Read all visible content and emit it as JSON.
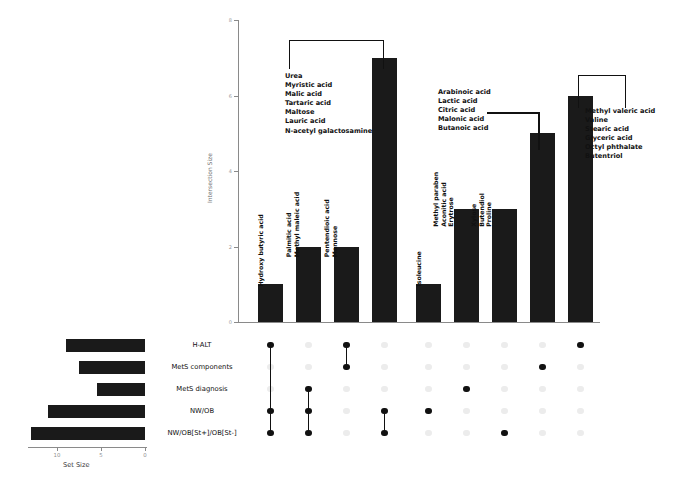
{
  "figure": {
    "type": "upset-plot",
    "background": "#ffffff",
    "mark_color": "#1a1a1a",
    "axis_color": "#8a8a8a"
  },
  "intersection_axis": {
    "title": "Intersection Size",
    "ticks": [
      "0",
      "2",
      "4",
      "6",
      "8"
    ],
    "tick_values": [
      0,
      2,
      4,
      6,
      8
    ],
    "max": 8
  },
  "setsize_axis": {
    "title": "Set Size",
    "ticks": [
      "10",
      "5",
      "0"
    ],
    "tick_values": [
      10,
      5,
      0
    ],
    "max": 14
  },
  "sets": [
    {
      "name": "H-ALT",
      "size": 9
    },
    {
      "name": "MetS components",
      "size": 7.5
    },
    {
      "name": "MetS diagnosis",
      "size": 5.5
    },
    {
      "name": "NW/OB",
      "size": 11
    },
    {
      "name": "NW/OB[St+]/OB[St-]",
      "size": 13
    }
  ],
  "intersections": [
    {
      "id": "i1",
      "size": 1,
      "members": [
        "H-ALT",
        "NW/OB",
        "NW/OB[St+]/OB[St-]"
      ],
      "metabolites": [
        "Hydroxy butyric acid"
      ],
      "label_style": "rotated"
    },
    {
      "id": "i2",
      "size": 2,
      "members": [
        "MetS diagnosis",
        "NW/OB",
        "NW/OB[St+]/OB[St-]"
      ],
      "metabolites": [
        "Palmitic acid",
        "Methyl maleic acid"
      ],
      "label_style": "rotated"
    },
    {
      "id": "i3",
      "size": 2,
      "members": [
        "H-ALT",
        "MetS components"
      ],
      "metabolites": [
        "Pentendioic acid",
        "Mannose"
      ],
      "label_style": "rotated"
    },
    {
      "id": "i4",
      "size": 7,
      "members": [
        "NW/OB",
        "NW/OB[St+]/OB[St-]"
      ],
      "metabolites": [
        "Urea",
        "Myristic acid",
        "Malic acid",
        "Tartaric acid",
        "Maltose",
        "Lauric acid",
        "N-acetyl galactosamine"
      ],
      "label_style": "callout"
    },
    {
      "id": "i5",
      "size": 1,
      "members": [
        "NW/OB"
      ],
      "metabolites": [
        "Isoleucine"
      ],
      "label_style": "rotated"
    },
    {
      "id": "i6",
      "size": 3,
      "members": [
        "MetS diagnosis"
      ],
      "metabolites": [
        "Methyl paraben",
        "Aconitic acid",
        "Erytrose"
      ],
      "label_style": "rotated"
    },
    {
      "id": "i7",
      "size": 3,
      "members": [
        "NW/OB[St+]/OB[St-]"
      ],
      "metabolites": [
        "Xylose",
        "Butendiol",
        "Proline"
      ],
      "label_style": "rotated"
    },
    {
      "id": "i8",
      "size": 5,
      "members": [
        "MetS components"
      ],
      "metabolites": [
        "Arabinoic acid",
        "Lactic acid",
        "Citric acid",
        "Malonic acid",
        "Butanoic acid"
      ],
      "label_style": "callout"
    },
    {
      "id": "i9",
      "size": 6,
      "members": [
        "H-ALT"
      ],
      "metabolites": [
        "Methyl valeric acid",
        "Valine",
        "Stearic acid",
        "Glyceric acid",
        "Octyl phthalate",
        "Butentriol"
      ],
      "label_style": "callout"
    }
  ],
  "callouts": {
    "left": {
      "lines": [
        "Urea",
        "Myristic acid",
        "Malic acid",
        "Tartaric acid",
        "Maltose",
        "Lauric acid",
        "N-acetyl galactosamine"
      ]
    },
    "middle": {
      "lines": [
        "Arabinoic acid",
        "Lactic acid",
        "Citric acid",
        "Malonic acid",
        "Butanoic acid"
      ]
    },
    "right": {
      "lines": [
        "Methyl valeric acid",
        "Valine",
        "Stearic acid",
        "Glyceric acid",
        "Octyl phthalate",
        "Butentriol"
      ]
    }
  },
  "rotated_labels": {
    "b1": [
      "Hydroxy butyric acid"
    ],
    "b2": [
      "Palmitic acid",
      "Methyl maleic acid"
    ],
    "b3": [
      "Pentendioic acid",
      "Mannose"
    ],
    "b5": [
      "Isoleucine"
    ],
    "b6": [
      "Methyl paraben",
      "Aconitic acid",
      "Erytrose"
    ],
    "b7": [
      "Xylose",
      "Butendiol",
      "Proline"
    ]
  },
  "chart_data": {
    "type": "bar",
    "title": "",
    "xlabel": "",
    "ylabel": "Intersection Size",
    "ylim": [
      0,
      8
    ],
    "categories": [
      "i1",
      "i2",
      "i3",
      "i4",
      "i5",
      "i6",
      "i7",
      "i8",
      "i9"
    ],
    "values": [
      1,
      2,
      2,
      7,
      1,
      3,
      3,
      5,
      6
    ],
    "grid": false,
    "legend": "none",
    "secondary": {
      "type": "bar",
      "orientation": "horizontal-reversed",
      "ylabel": "Set Size",
      "categories": [
        "H-ALT",
        "MetS components",
        "MetS diagnosis",
        "NW/OB",
        "NW/OB[St+]/OB[St-]"
      ],
      "values": [
        9,
        7.5,
        5.5,
        11,
        13
      ],
      "xlim": [
        14,
        0
      ],
      "ticks": [
        10,
        5,
        0
      ]
    },
    "matrix": [
      [
        1,
        0,
        0,
        1,
        1
      ],
      [
        0,
        0,
        1,
        1,
        1
      ],
      [
        1,
        1,
        0,
        0,
        0
      ],
      [
        0,
        0,
        0,
        1,
        1
      ],
      [
        0,
        0,
        0,
        1,
        0
      ],
      [
        0,
        0,
        1,
        0,
        0
      ],
      [
        0,
        0,
        0,
        0,
        1
      ],
      [
        0,
        1,
        0,
        0,
        0
      ],
      [
        1,
        0,
        0,
        0,
        0
      ]
    ]
  }
}
